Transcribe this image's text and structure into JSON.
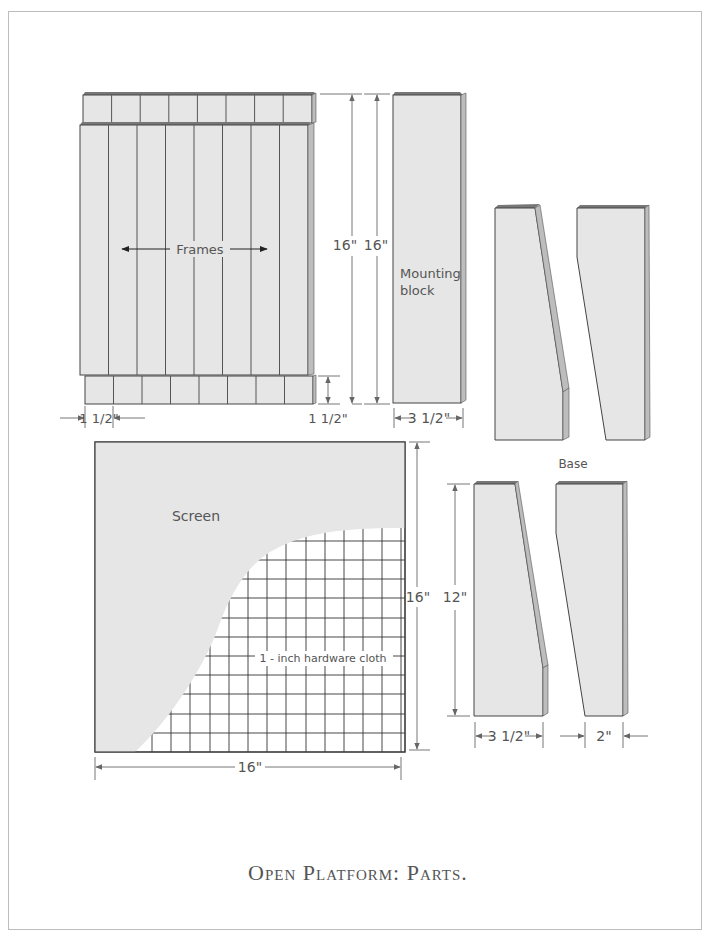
{
  "figure": {
    "caption": "Open Platform: Parts.",
    "colors": {
      "part_fill": "#e6e6e6",
      "part_edge_dark": "#777777",
      "part_side": "#bdbdbd",
      "outline": "#444444",
      "dimension_line": "#777777",
      "text": "#555555",
      "frame_border": "#bdbdbd"
    }
  },
  "frames_panel": {
    "label": "Frames",
    "width_dim": "1 1/2\"",
    "bottom_rail_dim": "1 1/2\"",
    "height_dim_inner": "16\"",
    "height_dim_outer": "16\"",
    "slat_count": 8
  },
  "mounting_block": {
    "label_line1": "Mounting",
    "label_line2": "block",
    "width_dim": "3 1/2\""
  },
  "base": {
    "label": "Base",
    "height_dim": "12\"",
    "width_dim_left": "3 1/2\"",
    "width_dim_right": "2\""
  },
  "screen": {
    "label": "Screen",
    "mesh_label": "1 - inch hardware cloth",
    "width_dim": "16\"",
    "height_dim": "16\""
  }
}
